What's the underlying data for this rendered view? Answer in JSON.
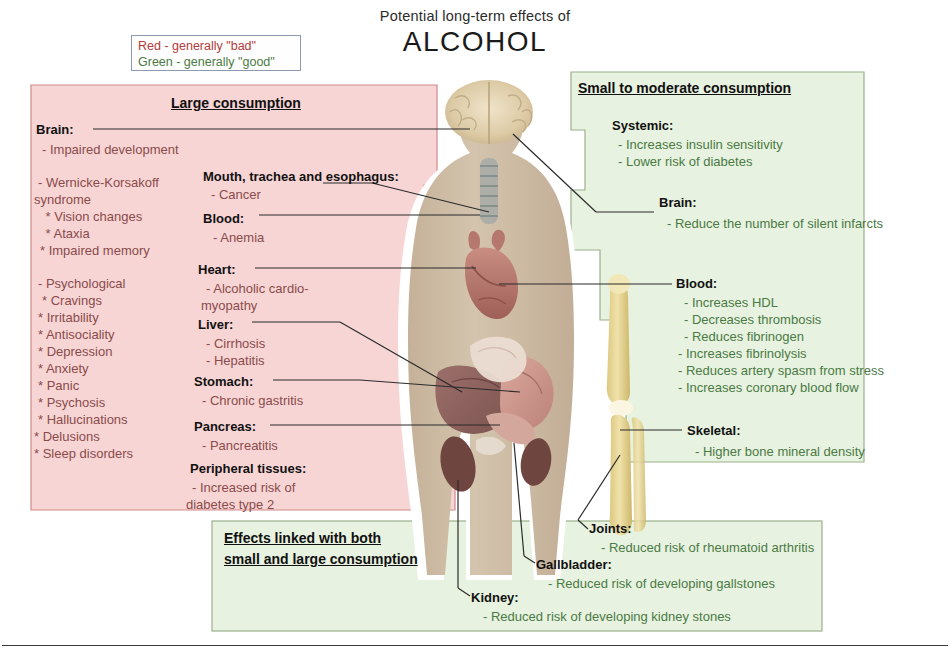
{
  "title": {
    "line1": "Potential long-term effects of",
    "line2": "ALCOHOL"
  },
  "legend": {
    "red": "Red - generally \"bad\"",
    "green": "Green - generally \"good\""
  },
  "panels": {
    "large": {
      "heading": "Large consumption",
      "color": "#f7d5d5",
      "border": "#d08a8a",
      "left_column": [
        {
          "head": "Brain:",
          "items": [
            "- Impaired development"
          ]
        },
        {
          "head": "",
          "items": [
            "- Wernicke-Korsakoff",
            "syndrome",
            " * Vision changes",
            " * Ataxia",
            "* Impaired memory"
          ]
        },
        {
          "head": "",
          "items": [
            "- Psychological",
            "* Cravings",
            "* Irritability",
            "* Antisociality",
            "* Depression",
            "* Anxiety",
            "* Panic",
            "* Psychosis",
            "* Hallucinations",
            "* Delusions",
            "* Sleep disorders"
          ]
        }
      ],
      "mid_column": [
        {
          "head": "Mouth, trachea and esophagus:",
          "items": [
            "- Cancer"
          ]
        },
        {
          "head": "Blood:",
          "items": [
            "- Anemia"
          ]
        },
        {
          "head": "Heart:",
          "items": [
            "- Alcoholic cardio-",
            "myopathy"
          ]
        },
        {
          "head": "Liver:",
          "items": [
            "- Cirrhosis",
            "- Hepatitis"
          ]
        },
        {
          "head": "Stomach:",
          "items": [
            "- Chronic gastritis"
          ]
        },
        {
          "head": "Pancreas:",
          "items": [
            "- Pancreatitis"
          ]
        },
        {
          "head": "Peripheral tissues:",
          "items": [
            "- Increased risk of",
            "diabetes type 2"
          ]
        }
      ]
    },
    "moderate": {
      "heading": "Small to moderate consumption",
      "color": "#e8f2e0",
      "border": "#9ab08c",
      "groups": [
        {
          "head": "Systemic:",
          "items": [
            "- Increases insulin sensitivity",
            "- Lower risk of diabetes"
          ]
        },
        {
          "head": "Brain:",
          "items": [
            "- Reduce the number of silent infarcts"
          ]
        },
        {
          "head": "Blood:",
          "items": [
            "- Increases HDL",
            "- Decreases thrombosis",
            "- Reduces fibrinogen",
            "- Increases fibrinolysis",
            "- Reduces artery spasm from stress",
            "- Increases coronary blood flow"
          ]
        },
        {
          "head": "Skeletal:",
          "items": [
            "- Higher bone mineral density"
          ]
        }
      ]
    },
    "both": {
      "heading_line1": "Effects linked with both",
      "heading_line2": "small and large consumption",
      "color": "#e8f2e0",
      "border": "#9ab08c",
      "groups": [
        {
          "head": "Joints:",
          "items": [
            "- Reduced risk of rheumatoid arthritis"
          ]
        },
        {
          "head": "Gallbladder:",
          "items": [
            "- Reduced risk of developing gallstones"
          ]
        },
        {
          "head": "Kidney:",
          "items": [
            "- Reduced risk of developing kidney stones"
          ]
        }
      ]
    }
  },
  "anatomy": {
    "organs": [
      "brain",
      "trachea",
      "heart",
      "liver",
      "stomach",
      "pancreas",
      "kidneys",
      "intestines",
      "bone"
    ],
    "body_color": "#cdbca6",
    "bone_color": "#e8d79a"
  }
}
